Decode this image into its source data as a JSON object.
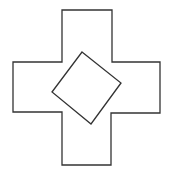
{
  "diagram": {
    "stroke_color": "#333333",
    "background": "#ffffff",
    "cross": {
      "points": "62,10 112,10 112,62 160,62 160,113 111,113 111,165 62,165 62,112 13,112 13,62 62,62"
    },
    "square": {
      "points": "82,52 121,83 91,124 52,92"
    }
  }
}
